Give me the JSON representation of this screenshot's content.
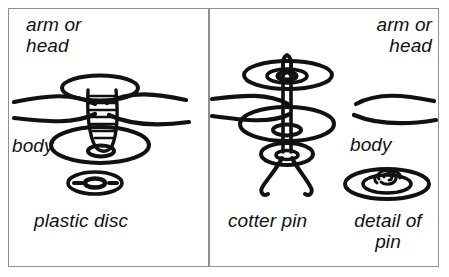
{
  "figure": {
    "background_color": "#ffffff",
    "ink_color": "#111111",
    "frame_color": "#8f8f8f",
    "panel_count": 2
  },
  "panels": [
    {
      "id": "left",
      "name": "plastic-disc-method",
      "labels": {
        "arm_or_head": "arm or\nhead",
        "body": "body",
        "component": "plastic disc"
      },
      "parts": [
        "upper-disc-arm-head",
        "ribbed-shank-rivet",
        "lower-disc-body",
        "small-plastic-disc"
      ]
    },
    {
      "id": "right",
      "name": "cotter-pin-method",
      "labels": {
        "arm_or_head": "arm or\nhead",
        "body": "body",
        "component": "cotter pin",
        "detail": "detail of\npin"
      },
      "parts": [
        "upper-disc-arm-head",
        "pin-head-loop",
        "pin-shank",
        "lower-disc-body",
        "washer-disc",
        "splayed-pin-legs",
        "pin-detail-disc"
      ]
    }
  ]
}
